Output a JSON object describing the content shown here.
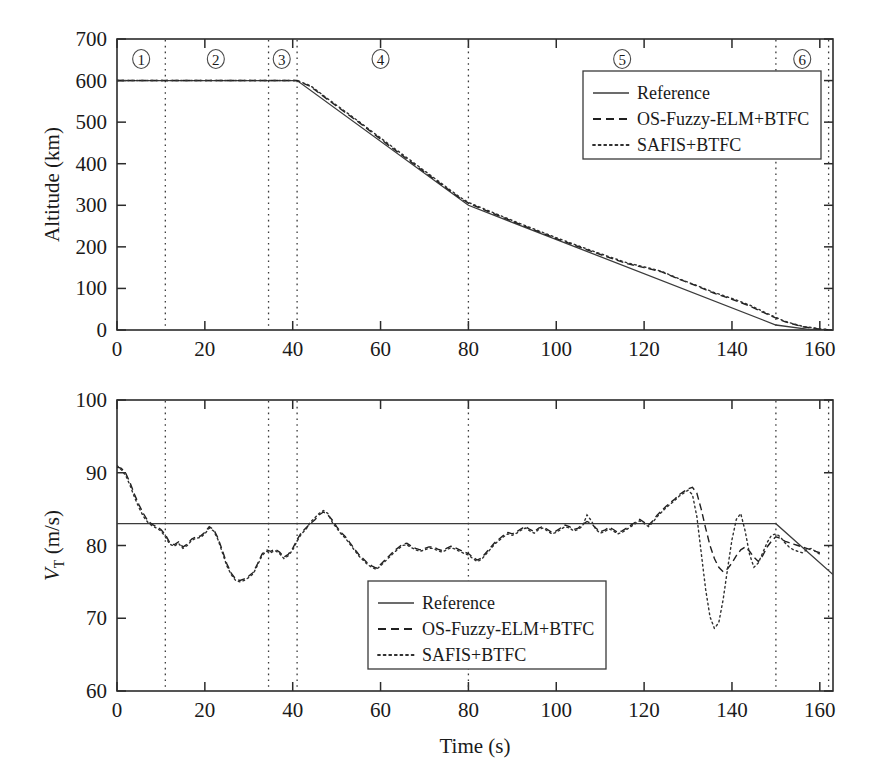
{
  "figure": {
    "background": "#ffffff",
    "ink_color": "#1a1a1a"
  },
  "chart_data": [
    {
      "id": "altitude_panel",
      "type": "line",
      "title": "",
      "xlabel": "",
      "ylabel": "Altitude (km)",
      "xlim": [
        0,
        163
      ],
      "ylim": [
        0,
        700
      ],
      "xticks": [
        0,
        20,
        40,
        60,
        80,
        100,
        120,
        140,
        160
      ],
      "yticks": [
        0,
        100,
        200,
        300,
        400,
        500,
        600,
        700
      ],
      "xticklabels": [
        "0",
        "20",
        "40",
        "60",
        "80",
        "100",
        "120",
        "140",
        "160"
      ],
      "yticklabels": [
        "0",
        "100",
        "200",
        "300",
        "400",
        "500",
        "600",
        "700"
      ],
      "grid": false,
      "legend_position": "upper right",
      "annotations": [
        {
          "label": "①",
          "x": 5.5
        },
        {
          "label": "②",
          "x": 22.5
        },
        {
          "label": "③",
          "x": 37.5
        },
        {
          "label": "④",
          "x": 60.0
        },
        {
          "label": "⑤",
          "x": 115.0
        },
        {
          "label": "⑥",
          "x": 156.0
        }
      ],
      "phase_lines": [
        11.0,
        34.5,
        41.0,
        80.0,
        150.0,
        162.0
      ],
      "series": [
        {
          "name": "Reference",
          "style": "solid",
          "x": [
            0,
            41,
            80,
            150,
            157,
            163
          ],
          "values": [
            600,
            600,
            300,
            12,
            2,
            0
          ]
        },
        {
          "name": "OS-Fuzzy-ELM+BTFC",
          "style": "dashed",
          "x": [
            0,
            10,
            20,
            30,
            41,
            44,
            48,
            55,
            62,
            70,
            78,
            80,
            85,
            92,
            100,
            108,
            116,
            120,
            124,
            128,
            132,
            136,
            140,
            144,
            148,
            152,
            156,
            160,
            163
          ],
          "values": [
            600,
            600,
            600,
            600,
            600,
            586,
            554,
            500,
            443,
            380,
            318,
            305,
            283,
            253,
            220,
            189,
            160,
            150,
            140,
            122,
            106,
            88,
            74,
            58,
            38,
            20,
            8,
            2,
            0
          ]
        },
        {
          "name": "SAFIS+BTFC",
          "style": "dotted",
          "x": [
            0,
            10,
            20,
            30,
            41,
            44,
            48,
            55,
            62,
            70,
            78,
            80,
            85,
            92,
            100,
            108,
            116,
            120,
            124,
            128,
            132,
            136,
            140,
            144,
            148,
            152,
            156,
            160,
            163
          ],
          "values": [
            600,
            600,
            600,
            600,
            600,
            588,
            556,
            502,
            446,
            383,
            320,
            307,
            285,
            255,
            222,
            191,
            162,
            152,
            141,
            123,
            107,
            90,
            76,
            60,
            40,
            21,
            9,
            3,
            0
          ]
        }
      ]
    },
    {
      "id": "velocity_panel",
      "type": "line",
      "title": "",
      "xlabel": "Time (s)",
      "ylabel": "V_T (m/s)",
      "ylabel_main": "V",
      "ylabel_sub": "T",
      "ylabel_unit": " (m/s)",
      "xlim": [
        0,
        163
      ],
      "ylim": [
        60,
        100
      ],
      "xticks": [
        0,
        20,
        40,
        60,
        80,
        100,
        120,
        140,
        160
      ],
      "yticks": [
        60,
        70,
        80,
        90,
        100
      ],
      "xticklabels": [
        "0",
        "20",
        "40",
        "60",
        "80",
        "100",
        "120",
        "140",
        "160"
      ],
      "yticklabels": [
        "60",
        "70",
        "80",
        "90",
        "100"
      ],
      "grid": false,
      "legend_position": "lower center",
      "phase_lines": [
        11.0,
        34.5,
        41.0,
        80.0,
        150.0,
        162.0
      ],
      "series": [
        {
          "name": "Reference",
          "style": "solid",
          "x": [
            0,
            150,
            163
          ],
          "values": [
            83,
            83,
            76
          ]
        },
        {
          "name": "OS-Fuzzy-ELM+BTFC",
          "style": "dashed",
          "x": [
            0,
            1,
            2,
            3,
            4,
            5,
            6,
            7,
            8,
            9,
            10,
            11,
            12,
            13,
            14,
            15,
            16,
            17,
            18,
            19,
            20,
            21,
            22,
            23,
            24,
            25,
            26,
            27,
            28,
            29,
            30,
            31,
            32,
            33,
            34,
            35,
            36,
            37,
            38,
            39,
            40,
            41,
            42,
            43,
            44,
            45,
            46,
            47,
            48,
            49,
            50,
            51,
            52,
            53,
            54,
            55,
            56,
            57,
            58,
            59,
            60,
            61,
            62,
            63,
            64,
            65,
            66,
            67,
            68,
            69,
            70,
            71,
            72,
            73,
            74,
            75,
            76,
            77,
            78,
            79,
            80,
            81,
            82,
            83,
            84,
            85,
            86,
            87,
            88,
            89,
            90,
            91,
            92,
            93,
            94,
            95,
            96,
            97,
            98,
            99,
            100,
            101,
            102,
            103,
            104,
            105,
            106,
            107,
            108,
            109,
            110,
            111,
            112,
            113,
            114,
            115,
            116,
            117,
            118,
            119,
            120,
            121,
            122,
            123,
            124,
            125,
            126,
            127,
            128,
            129,
            130,
            131,
            132,
            133,
            134,
            135,
            136,
            137,
            138,
            139,
            140,
            141,
            142,
            143,
            144,
            145,
            146,
            147,
            148,
            149,
            150,
            151,
            152,
            153,
            154,
            155,
            156,
            157,
            158,
            159,
            160,
            161,
            162,
            163
          ],
          "values": [
            90.8,
            90.6,
            89.9,
            88.6,
            87.0,
            85.6,
            84.4,
            83.4,
            82.9,
            82.6,
            82.2,
            81.5,
            80.4,
            80.1,
            80.5,
            79.8,
            80.2,
            80.9,
            81.2,
            81.3,
            81.8,
            82.6,
            82.2,
            81.0,
            79.3,
            77.5,
            76.2,
            75.4,
            75.2,
            75.4,
            75.8,
            76.3,
            77.5,
            78.8,
            79.4,
            79.2,
            79.5,
            79.1,
            78.4,
            78.8,
            79.6,
            80.8,
            81.8,
            82.4,
            83.0,
            83.5,
            84.2,
            84.6,
            84.2,
            83.5,
            82.6,
            81.8,
            81.2,
            80.4,
            79.6,
            78.8,
            78.2,
            77.6,
            77.2,
            76.9,
            77.4,
            78.0,
            78.6,
            79.2,
            79.7,
            80.2,
            80.3,
            79.9,
            79.6,
            79.4,
            79.6,
            79.8,
            79.8,
            79.5,
            79.3,
            79.6,
            79.9,
            79.7,
            79.4,
            79.1,
            78.9,
            78.4,
            78.0,
            78.3,
            79.0,
            79.7,
            80.4,
            80.9,
            81.4,
            81.8,
            81.6,
            81.9,
            82.3,
            82.6,
            82.2,
            81.9,
            82.4,
            82.6,
            82.2,
            81.8,
            82.0,
            82.4,
            82.8,
            82.6,
            82.2,
            82.4,
            82.9,
            83.3,
            83.0,
            82.4,
            81.9,
            82.1,
            82.5,
            82.2,
            81.8,
            82.0,
            82.4,
            82.8,
            83.2,
            83.6,
            83.2,
            82.8,
            83.4,
            84.2,
            84.8,
            85.4,
            85.9,
            86.4,
            87.0,
            87.4,
            87.8,
            88.0,
            87.2,
            85.0,
            82.4,
            80.0,
            78.2,
            77.0,
            76.4,
            76.8,
            77.6,
            78.6,
            79.4,
            79.8,
            79.2,
            78.4,
            77.8,
            78.6,
            79.8,
            80.6,
            81.2,
            81.0,
            80.6,
            80.4,
            80.2,
            80.0,
            79.8,
            79.6,
            79.4,
            79.2,
            79.0
          ]
        },
        {
          "name": "SAFIS+BTFC",
          "style": "dotted",
          "x": [
            0,
            1,
            2,
            3,
            4,
            5,
            6,
            7,
            8,
            9,
            10,
            11,
            12,
            13,
            14,
            15,
            16,
            17,
            18,
            19,
            20,
            21,
            22,
            23,
            24,
            25,
            26,
            27,
            28,
            29,
            30,
            31,
            32,
            33,
            34,
            35,
            36,
            37,
            38,
            39,
            40,
            41,
            42,
            43,
            44,
            45,
            46,
            47,
            48,
            49,
            50,
            51,
            52,
            53,
            54,
            55,
            56,
            57,
            58,
            59,
            60,
            61,
            62,
            63,
            64,
            65,
            66,
            67,
            68,
            69,
            70,
            71,
            72,
            73,
            74,
            75,
            76,
            77,
            78,
            79,
            80,
            81,
            82,
            83,
            84,
            85,
            86,
            87,
            88,
            89,
            90,
            91,
            92,
            93,
            94,
            95,
            96,
            97,
            98,
            99,
            100,
            101,
            102,
            103,
            104,
            105,
            106,
            107,
            108,
            109,
            110,
            111,
            112,
            113,
            114,
            115,
            116,
            117,
            118,
            119,
            120,
            121,
            122,
            123,
            124,
            125,
            126,
            127,
            128,
            129,
            130,
            131,
            132,
            133,
            134,
            135,
            136,
            137,
            138,
            139,
            140,
            141,
            142,
            143,
            144,
            145,
            146,
            147,
            148,
            149,
            150,
            151,
            152,
            153,
            154,
            155,
            156,
            157,
            158,
            159,
            160,
            161,
            162,
            163
          ],
          "values": [
            91.0,
            90.4,
            89.6,
            88.2,
            86.6,
            85.2,
            84.0,
            83.2,
            82.7,
            82.4,
            82.0,
            81.2,
            80.2,
            79.9,
            80.3,
            79.6,
            80.0,
            80.7,
            81.0,
            81.1,
            81.6,
            82.4,
            82.0,
            80.8,
            79.0,
            77.2,
            76.0,
            75.2,
            75.0,
            75.2,
            75.6,
            76.1,
            77.3,
            78.6,
            79.2,
            79.0,
            79.3,
            78.9,
            78.2,
            78.6,
            79.4,
            80.6,
            81.6,
            82.2,
            83.2,
            83.8,
            84.4,
            84.8,
            84.4,
            83.2,
            82.4,
            81.6,
            81.0,
            80.2,
            79.4,
            78.6,
            78.0,
            77.4,
            77.0,
            76.7,
            77.2,
            77.8,
            78.4,
            79.0,
            79.5,
            80.0,
            80.1,
            79.7,
            79.4,
            79.2,
            79.4,
            79.6,
            79.6,
            79.3,
            79.1,
            79.4,
            79.7,
            79.5,
            79.2,
            78.9,
            78.7,
            78.2,
            77.8,
            78.1,
            78.8,
            79.5,
            80.2,
            80.7,
            81.2,
            81.6,
            81.4,
            81.7,
            82.1,
            82.4,
            82.0,
            81.7,
            82.2,
            82.4,
            82.0,
            81.6,
            81.8,
            82.2,
            82.6,
            82.4,
            82.0,
            82.2,
            82.7,
            84.2,
            83.4,
            82.2,
            81.7,
            81.9,
            82.3,
            82.0,
            81.6,
            81.8,
            82.2,
            82.6,
            83.0,
            83.4,
            83.0,
            82.6,
            83.2,
            84.0,
            84.6,
            85.2,
            85.7,
            86.2,
            86.8,
            87.2,
            87.6,
            87.0,
            84.0,
            79.0,
            74.0,
            70.2,
            68.6,
            69.4,
            72.6,
            76.8,
            80.8,
            83.6,
            84.4,
            82.0,
            78.8,
            77.0,
            77.6,
            79.0,
            80.4,
            81.4,
            81.6,
            81.2,
            80.4,
            79.8,
            79.4,
            79.2,
            79.0,
            79.4,
            79.6,
            79.2,
            78.8
          ]
        }
      ]
    }
  ],
  "legend": {
    "entries": [
      {
        "label": "Reference",
        "style": "solid"
      },
      {
        "label": "OS-Fuzzy-ELM+BTFC",
        "style": "dashed"
      },
      {
        "label": "SAFIS+BTFC",
        "style": "dotted"
      }
    ]
  }
}
